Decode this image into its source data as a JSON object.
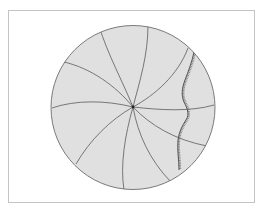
{
  "figure": {
    "colors": {
      "frame_border": "#c4c4c4",
      "disc_fill": "#e0e0e0",
      "disc_stroke": "#7a7a7a",
      "spiral_stroke": "#6a6a6a",
      "wavy_stroke": "#555555",
      "center_dot": "#222222"
    },
    "disc": {
      "cx": 133,
      "cy": 107.5,
      "r": 82
    },
    "center": {
      "x": 133,
      "y": 107
    },
    "spirals": [
      "M133,107 C122,80 108,55 99,26",
      "M133,107 C140,80 148,55 148,25",
      "M133,107 C155,95 178,75 188,48",
      "M133,107 C160,110 190,112 214,105",
      "M133,107 C150,125 175,140 207,146",
      "M133,107 C138,135 150,160 170,181",
      "M133,107 C125,135 120,165 124,190",
      "M133,107 C110,120 90,140 76,164",
      "M133,107 C105,100 75,100 52,108",
      "M133,107 C115,85 90,68 64,62"
    ],
    "wavy_line": "M194,52 C192,62 188,72 185,80 C182,88 181,95 184,102 C187,108 190,114 186,120 C182,126 179,132 178,140 C177,150 179,160 179,170",
    "labels": []
  }
}
